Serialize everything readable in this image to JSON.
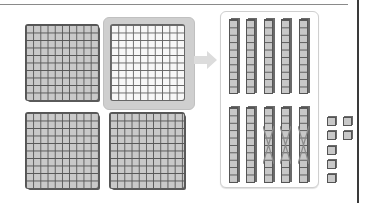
{
  "diagram": {
    "colors": {
      "block_fill": "#c9c9c9",
      "block_line": "#555555",
      "highlight_fill": "#cfcfcf",
      "selected_flat_fill": "#f7f7f7",
      "arrow": "#dcdcdc",
      "panel_border": "#cfcfcf"
    },
    "hundreds_flats": [
      {
        "id": 1,
        "selected": false,
        "grid": "10x10"
      },
      {
        "id": 2,
        "selected": true,
        "grid": "10x10"
      },
      {
        "id": 3,
        "selected": false,
        "grid": "10x10"
      },
      {
        "id": 4,
        "selected": false,
        "grid": "10x10"
      }
    ],
    "exchange_arrow": "right-arrow",
    "tens_rods": {
      "top_row_count": 5,
      "bottom_row_count": 5,
      "crossed_out_count": 3
    },
    "ones_units": {
      "count": 7,
      "left_column": 5,
      "right_column": 2
    }
  }
}
